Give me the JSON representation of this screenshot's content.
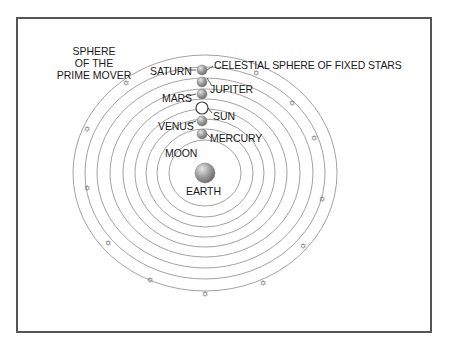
{
  "diagram": {
    "type": "geocentric-cosmos",
    "center": {
      "x": 205,
      "y": 173
    },
    "colors": {
      "ring": "#8a8a8a",
      "frame": "#555555",
      "planet_fill": "#9a9a9a",
      "sun_fill": "#ffffff",
      "text": "#1a1a1a",
      "star": "#777777"
    },
    "rings": [
      {
        "name": "moon",
        "rx": 36,
        "ry": 33
      },
      {
        "name": "mercury",
        "rx": 48,
        "ry": 44
      },
      {
        "name": "venus",
        "rx": 59,
        "ry": 54
      },
      {
        "name": "sun",
        "rx": 70,
        "ry": 64
      },
      {
        "name": "mars",
        "rx": 82,
        "ry": 74
      },
      {
        "name": "jupiter",
        "rx": 95,
        "ry": 84
      },
      {
        "name": "saturn",
        "rx": 108,
        "ry": 95
      },
      {
        "name": "fixed-stars",
        "rx": 120,
        "ry": 106
      },
      {
        "name": "prime-mover",
        "rx": 132,
        "ry": 118
      }
    ],
    "bodies": [
      {
        "name": "earth",
        "label": "EARTH",
        "x": 205,
        "y": 173,
        "r": 10
      },
      {
        "name": "moon",
        "label": "MOON",
        "x": 207,
        "y": 144
      },
      {
        "name": "mercury",
        "label": "MERCURY",
        "x": 202,
        "y": 134,
        "r": 5
      },
      {
        "name": "venus",
        "label": "VENUS",
        "x": 202,
        "y": 121,
        "r": 5
      },
      {
        "name": "sun",
        "label": "SUN",
        "x": 202,
        "y": 108,
        "r": 6
      },
      {
        "name": "mars",
        "label": "MARS",
        "x": 202,
        "y": 94,
        "r": 5
      },
      {
        "name": "jupiter",
        "label": "JUPITER",
        "x": 202,
        "y": 82,
        "r": 5
      },
      {
        "name": "saturn",
        "label": "SATURN",
        "x": 202,
        "y": 70,
        "r": 5
      }
    ],
    "stars": [
      {
        "x": 126,
        "y": 83
      },
      {
        "x": 256,
        "y": 73
      },
      {
        "x": 292,
        "y": 103
      },
      {
        "x": 314,
        "y": 138
      },
      {
        "x": 87,
        "y": 129
      },
      {
        "x": 87,
        "y": 188
      },
      {
        "x": 108,
        "y": 243
      },
      {
        "x": 150,
        "y": 280
      },
      {
        "x": 205,
        "y": 294
      },
      {
        "x": 263,
        "y": 283
      },
      {
        "x": 303,
        "y": 246
      },
      {
        "x": 322,
        "y": 199
      }
    ]
  },
  "labels": {
    "prime_mover_line1": "SPHERE",
    "prime_mover_line2": "OF THE",
    "prime_mover_line3": "PRIME MOVER",
    "fixed_stars": "CELESTIAL SPHERE OF FIXED STARS",
    "saturn": "SATURN",
    "jupiter": "JUPITER",
    "mars": "MARS",
    "sun": "SUN",
    "venus": "VENUS",
    "mercury": "MERCURY",
    "moon": "MOON",
    "earth": "EARTH"
  }
}
